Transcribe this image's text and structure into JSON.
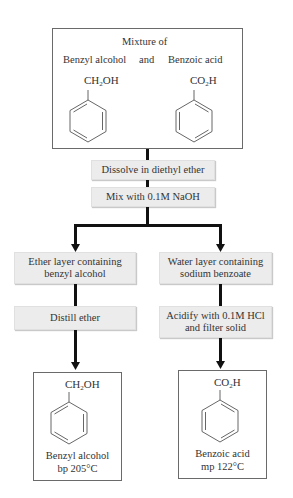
{
  "diagram": {
    "type": "flowchart",
    "start": {
      "heading": "Mixture of",
      "left_compound": "Benzyl alcohol",
      "conjunction": "and",
      "right_compound": "Benzoic acid",
      "left_formula": {
        "pre": "CH",
        "sub": "2",
        "post": "OH"
      },
      "right_formula": {
        "pre": "CO",
        "sub": "2",
        "post": "H"
      }
    },
    "steps": [
      {
        "id": "dissolve",
        "label": "Dissolve in diethyl ether"
      },
      {
        "id": "mix",
        "label": "Mix with 0.1M NaOH"
      }
    ],
    "branches": {
      "left": {
        "layer": {
          "line1": "Ether layer containing",
          "line2": "benzyl alcohol"
        },
        "step": "Distill ether",
        "product": {
          "formula": {
            "pre": "CH",
            "sub": "2",
            "post": "OH"
          },
          "name": "Benzyl alcohol",
          "property": "bp 205°C"
        }
      },
      "right": {
        "layer": {
          "line1": "Water layer containing",
          "line2": "sodium benzoate"
        },
        "step": {
          "line1": "Acidify with 0.1M HCl",
          "line2": "and filter solid"
        },
        "product": {
          "formula": {
            "pre": "CO",
            "sub": "2",
            "post": "H"
          },
          "name": "Benzoic acid",
          "property": "mp 122°C"
        }
      }
    },
    "colors": {
      "step_fill": "#ececec",
      "connector": "#111111",
      "outline": "#6a6a6a"
    }
  }
}
